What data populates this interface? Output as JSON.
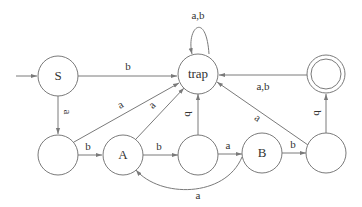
{
  "diagram": {
    "type": "finite-automaton",
    "nodes": [
      {
        "id": "S",
        "label": "S",
        "start": true,
        "accept": false
      },
      {
        "id": "trap",
        "label": "trap",
        "start": false,
        "accept": false
      },
      {
        "id": "acc",
        "label": "",
        "start": false,
        "accept": true
      },
      {
        "id": "q1",
        "label": "",
        "start": false,
        "accept": false
      },
      {
        "id": "A",
        "label": "A",
        "start": false,
        "accept": false
      },
      {
        "id": "q3",
        "label": "",
        "start": false,
        "accept": false
      },
      {
        "id": "B",
        "label": "B",
        "start": false,
        "accept": false
      },
      {
        "id": "q5",
        "label": "",
        "start": false,
        "accept": false
      }
    ],
    "edges": [
      {
        "from": "S",
        "to": "trap",
        "label": "b"
      },
      {
        "from": "S",
        "to": "q1",
        "label": "a"
      },
      {
        "from": "trap",
        "to": "trap",
        "label": "a,b"
      },
      {
        "from": "acc",
        "to": "trap",
        "label": "a,b"
      },
      {
        "from": "q1",
        "to": "A",
        "label": "b"
      },
      {
        "from": "q1",
        "to": "trap",
        "label": "a"
      },
      {
        "from": "A",
        "to": "trap",
        "label": "a"
      },
      {
        "from": "A",
        "to": "q3",
        "label": "b"
      },
      {
        "from": "q3",
        "to": "trap",
        "label": "b"
      },
      {
        "from": "q3",
        "to": "B",
        "label": "a"
      },
      {
        "from": "B",
        "to": "A",
        "label": "a"
      },
      {
        "from": "B",
        "to": "q5",
        "label": "b"
      },
      {
        "from": "q5",
        "to": "trap",
        "label": "a"
      },
      {
        "from": "q5",
        "to": "acc",
        "label": "b"
      }
    ]
  }
}
